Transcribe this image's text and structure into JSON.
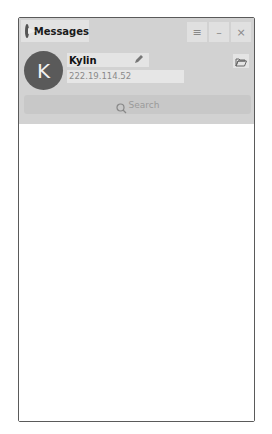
{
  "window": {
    "title": "Messages",
    "app_icon": "messages-logo-icon",
    "controls": {
      "menu": {
        "icon": "menu-icon",
        "glyph": "≡"
      },
      "minimize": {
        "icon": "minimize-icon",
        "glyph": "–"
      },
      "close": {
        "icon": "close-icon",
        "glyph": "×"
      }
    }
  },
  "profile": {
    "avatar_letter": "K",
    "name": "Kylin",
    "edit_icon": "pencil-icon",
    "ip_address": "222.19.114.52",
    "folder_icon": "folder-open-icon"
  },
  "search": {
    "placeholder": "Search",
    "icon": "search-icon"
  },
  "colors": {
    "header_bg": "#d2d2d2",
    "avatar_bg": "#5a5a5a",
    "body_bg": "#ffffff"
  }
}
